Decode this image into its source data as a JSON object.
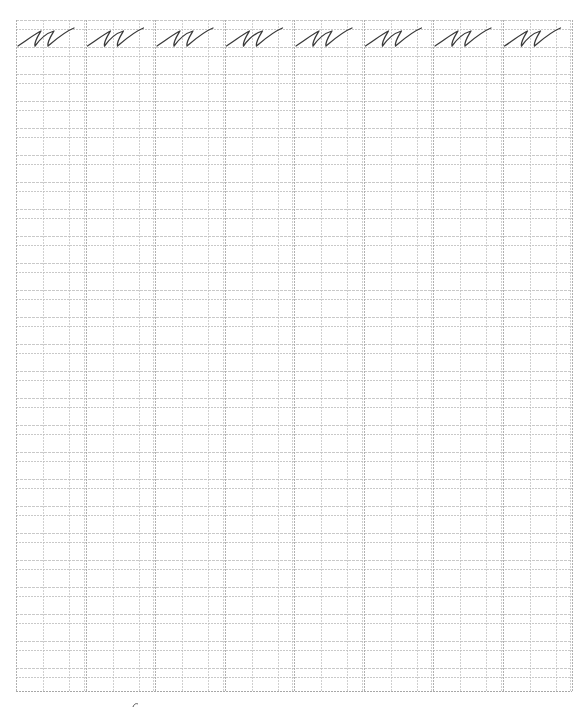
{
  "worksheet": {
    "type": "cursive handwriting practice sheet",
    "practice_letter": "ш",
    "letter_style": "cursive lowercase Cyrillic sha",
    "columns": 8,
    "example_row_letters": [
      "ш",
      "ш",
      "ш",
      "ш",
      "ш",
      "ш",
      "ш",
      "ш"
    ],
    "grid": {
      "left": 16,
      "top": 20,
      "right": 572,
      "bottom": 691,
      "column_width": 69.5,
      "column_inner_offsets": [
        27,
        53
      ],
      "row_period": 27,
      "row_line_offsets": [
        0,
        9
      ],
      "line_color": "#bcbcbc",
      "border_color": "#a8a8a8"
    },
    "ink_color": "#3a3a3a",
    "footer_mark": "page number fragment"
  }
}
